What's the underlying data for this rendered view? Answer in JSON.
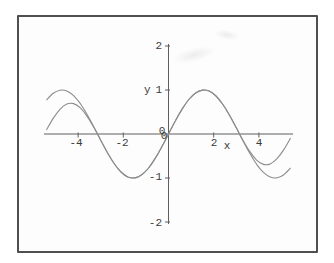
{
  "figure": {
    "background": "#ffffff",
    "frame_color": "#4f4f4f",
    "axis_color": "#5f5f5f",
    "curve_color": "#8c8c8c",
    "text_color": "#3a3a3a"
  },
  "labels": {
    "x_axis": "x",
    "y_axis": "y",
    "origin_x": "0",
    "origin_y": "0"
  },
  "chart_data": {
    "type": "line",
    "title": "",
    "xlabel": "x",
    "ylabel": "y",
    "xlim": [
      -5.5,
      5.5
    ],
    "ylim": [
      -2,
      2
    ],
    "grid": false,
    "legend": "none",
    "x_ticks": [
      {
        "value": -4,
        "label": "-4"
      },
      {
        "value": -2,
        "label": "-2"
      },
      {
        "value": 2,
        "label": "2"
      },
      {
        "value": 4,
        "label": "4"
      }
    ],
    "y_ticks": [
      {
        "value": 2,
        "label": "2"
      },
      {
        "value": 1,
        "label": "1"
      },
      {
        "value": -1,
        "label": "-1"
      },
      {
        "value": -2,
        "label": "-2"
      }
    ],
    "x": [
      -5.4,
      -5.1,
      -4.8,
      -4.5,
      -4.2,
      -3.9,
      -3.6,
      -3.3,
      -3.0,
      -2.7,
      -2.4,
      -2.1,
      -1.8,
      -1.5,
      -1.2,
      -0.9,
      -0.6,
      -0.3,
      0,
      0.3,
      0.6,
      0.9,
      1.2,
      1.5,
      1.8,
      2.1,
      2.4,
      2.7,
      3.0,
      3.3,
      3.6,
      3.9,
      4.2,
      4.5,
      4.8,
      5.1,
      5.4
    ],
    "series": [
      {
        "name": "sine",
        "values": [
          0.773,
          0.926,
          0.996,
          0.978,
          0.872,
          0.688,
          0.443,
          0.158,
          -0.141,
          -0.427,
          -0.675,
          -0.863,
          -0.974,
          -0.997,
          -0.932,
          -0.783,
          -0.565,
          -0.296,
          0,
          0.296,
          0.565,
          0.783,
          0.932,
          0.997,
          0.974,
          0.863,
          0.675,
          0.427,
          0.141,
          -0.158,
          -0.443,
          -0.688,
          -0.872,
          -0.978,
          -0.996,
          -0.926,
          -0.773
        ]
      },
      {
        "name": "approximation",
        "values": [
          0.093,
          0.355,
          0.562,
          0.68,
          0.691,
          0.593,
          0.401,
          0.147,
          -0.141,
          -0.427,
          -0.675,
          -0.863,
          -0.974,
          -0.997,
          -0.932,
          -0.783,
          -0.565,
          -0.296,
          0,
          0.296,
          0.565,
          0.783,
          0.932,
          0.997,
          0.974,
          0.863,
          0.675,
          0.427,
          0.141,
          -0.147,
          -0.401,
          -0.593,
          -0.691,
          -0.68,
          -0.562,
          -0.355,
          -0.093
        ]
      }
    ]
  }
}
